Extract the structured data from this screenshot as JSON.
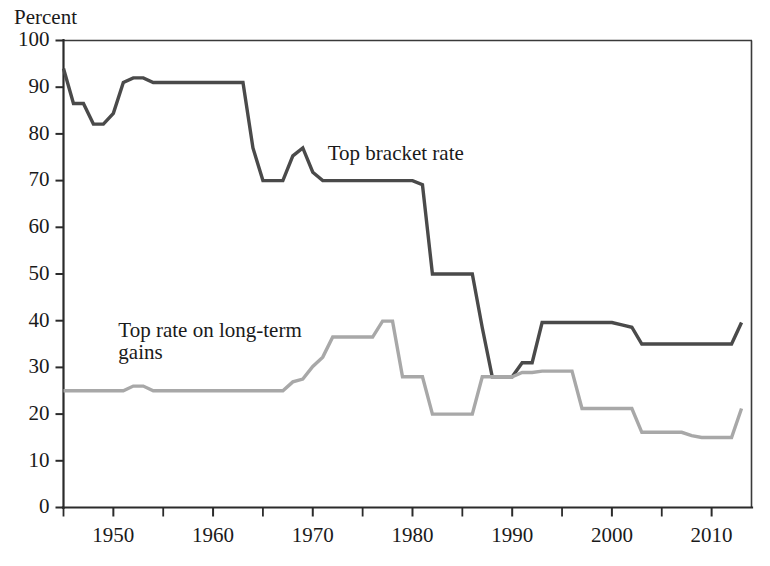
{
  "chart_data": {
    "type": "line",
    "title": "",
    "xlabel": "",
    "ylabel": "Percent",
    "ylim": [
      0,
      100
    ],
    "xlim": [
      1945,
      2014
    ],
    "grid": false,
    "legend_position": "inline-annotations",
    "y_ticks": [
      0,
      10,
      20,
      30,
      40,
      50,
      60,
      70,
      80,
      90,
      100
    ],
    "y_tick_labels": [
      "0",
      "10",
      "20",
      "30",
      "40",
      "50",
      "60",
      "70",
      "80",
      "90",
      "100"
    ],
    "x_ticks": [
      1950,
      1960,
      1970,
      1980,
      1990,
      2000,
      2010
    ],
    "x_tick_labels": [
      "1950",
      "1960",
      "1970",
      "1980",
      "1990",
      "2000",
      "2010"
    ],
    "x_minor_ticks": [
      1945,
      1955,
      1965,
      1975,
      1985,
      1995,
      2005
    ],
    "series": [
      {
        "name": "Top bracket rate",
        "color": "#4a4a4a",
        "width": 3.4,
        "label_x": 1971.5,
        "label_y": 74.5,
        "x": [
          1945,
          1946,
          1947,
          1948,
          1949,
          1950,
          1951,
          1952,
          1953,
          1954,
          1955,
          1956,
          1957,
          1958,
          1959,
          1960,
          1961,
          1962,
          1963,
          1964,
          1965,
          1966,
          1967,
          1968,
          1969,
          1970,
          1971,
          1972,
          1973,
          1974,
          1975,
          1976,
          1977,
          1978,
          1979,
          1980,
          1981,
          1982,
          1983,
          1984,
          1985,
          1986,
          1987,
          1988,
          1989,
          1990,
          1991,
          1992,
          1993,
          1994,
          1995,
          1996,
          1997,
          1998,
          1999,
          2000,
          2001,
          2002,
          2003,
          2004,
          2005,
          2006,
          2007,
          2008,
          2009,
          2010,
          2011,
          2012,
          2013
        ],
        "values": [
          94,
          86.5,
          86.5,
          82.1,
          82.1,
          84.4,
          91,
          92,
          92,
          91,
          91,
          91,
          91,
          91,
          91,
          91,
          91,
          91,
          91,
          77,
          70,
          70,
          70,
          75.3,
          77,
          71.8,
          70,
          70,
          70,
          70,
          70,
          70,
          70,
          70,
          70,
          70,
          69.1,
          50,
          50,
          50,
          50,
          50,
          38.5,
          28,
          28,
          28,
          31,
          31,
          39.6,
          39.6,
          39.6,
          39.6,
          39.6,
          39.6,
          39.6,
          39.6,
          39.1,
          38.6,
          35,
          35,
          35,
          35,
          35,
          35,
          35,
          35,
          35,
          35,
          39.6
        ]
      },
      {
        "name": "Top rate on long-term gains",
        "color": "#a8a8a8",
        "width": 3.4,
        "label_x": 1950.5,
        "label_y": 36.5,
        "label_line2_dy": 22,
        "x": [
          1945,
          1946,
          1947,
          1948,
          1949,
          1950,
          1951,
          1952,
          1953,
          1954,
          1955,
          1956,
          1957,
          1958,
          1959,
          1960,
          1961,
          1962,
          1963,
          1964,
          1965,
          1966,
          1967,
          1968,
          1969,
          1970,
          1971,
          1972,
          1973,
          1974,
          1975,
          1976,
          1977,
          1978,
          1979,
          1980,
          1981,
          1982,
          1983,
          1984,
          1985,
          1986,
          1987,
          1988,
          1989,
          1990,
          1991,
          1992,
          1993,
          1994,
          1995,
          1996,
          1997,
          1998,
          1999,
          2000,
          2001,
          2002,
          2003,
          2004,
          2005,
          2006,
          2007,
          2008,
          2009,
          2010,
          2011,
          2012,
          2013
        ],
        "values": [
          25,
          25,
          25,
          25,
          25,
          25,
          25,
          26,
          26,
          25,
          25,
          25,
          25,
          25,
          25,
          25,
          25,
          25,
          25,
          25,
          25,
          25,
          25,
          26.9,
          27.5,
          30.2,
          32.2,
          36.5,
          36.5,
          36.5,
          36.5,
          36.5,
          39.9,
          39.9,
          28,
          28,
          28,
          20,
          20,
          20,
          20,
          20,
          28,
          28,
          28,
          28,
          28.9,
          28.9,
          29.2,
          29.2,
          29.2,
          29.2,
          21.2,
          21.2,
          21.2,
          21.2,
          21.2,
          21.2,
          16.1,
          16.1,
          16.1,
          16.1,
          16.1,
          15.4,
          15,
          15,
          15,
          15,
          21.2
        ]
      }
    ]
  },
  "annotations": {
    "top_bracket_label": "Top bracket rate",
    "gains_label_line1": "Top rate on long-term",
    "gains_label_line2": "gains",
    "y_axis_title": "Percent"
  }
}
